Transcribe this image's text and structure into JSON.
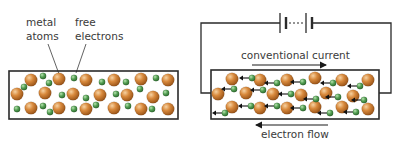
{
  "left_panel": {
    "labels": {
      "metal_atoms": [
        "metal",
        "atoms"
      ],
      "free_electrons": [
        "free",
        "electrons"
      ]
    },
    "box": {
      "x": 9,
      "y": 71,
      "w": 169,
      "h": 48
    },
    "atoms": [
      [
        31,
        80
      ],
      [
        59,
        79
      ],
      [
        86,
        80
      ],
      [
        114,
        80
      ],
      [
        141,
        79
      ],
      [
        168,
        80
      ],
      [
        17,
        94
      ],
      [
        45,
        93
      ],
      [
        73,
        94
      ],
      [
        100,
        95
      ],
      [
        127,
        95
      ],
      [
        153,
        97
      ],
      [
        31,
        108
      ],
      [
        59,
        108
      ],
      [
        86,
        109
      ],
      [
        114,
        108
      ],
      [
        141,
        109
      ],
      [
        168,
        109
      ]
    ],
    "electrons": [
      [
        43,
        76
      ],
      [
        49,
        83
      ],
      [
        24,
        87
      ],
      [
        74,
        78
      ],
      [
        102,
        82
      ],
      [
        126,
        82
      ],
      [
        156,
        78
      ],
      [
        62,
        95
      ],
      [
        86,
        98
      ],
      [
        116,
        94
      ],
      [
        140,
        89
      ],
      [
        166,
        93
      ],
      [
        17,
        109
      ],
      [
        43,
        106
      ],
      [
        50,
        112
      ],
      [
        74,
        109
      ],
      [
        96,
        105
      ],
      [
        128,
        106
      ],
      [
        152,
        109
      ]
    ]
  },
  "right_panel": {
    "circuit": {
      "left": 201,
      "top": 23,
      "right": 391,
      "bottom": 93
    },
    "battery": {
      "long_plates": [
        280,
        306
      ],
      "short_plates": [
        286,
        312
      ],
      "y": 23
    },
    "box": {
      "x": 211,
      "y": 70,
      "w": 168,
      "h": 49
    },
    "conventional_current": {
      "label": "conventional current",
      "arrow_x1": 252,
      "arrow_x2": 328,
      "y": 65
    },
    "electron_flow": {
      "label": "electron flow",
      "arrow_x1": 328,
      "arrow_x2": 254,
      "y": 125
    },
    "atoms": [
      [
        232,
        79
      ],
      [
        260,
        80
      ],
      [
        287,
        80
      ],
      [
        315,
        78
      ],
      [
        342,
        80
      ],
      [
        368,
        80
      ],
      [
        218,
        94
      ],
      [
        246,
        93
      ],
      [
        273,
        94
      ],
      [
        301,
        95
      ],
      [
        326,
        93
      ],
      [
        353,
        96
      ],
      [
        232,
        107
      ],
      [
        260,
        108
      ],
      [
        287,
        108
      ],
      [
        315,
        107
      ],
      [
        342,
        107
      ],
      [
        368,
        109
      ]
    ],
    "electrons_with_arrows": [
      [
        252,
        78
      ],
      [
        277,
        83
      ],
      [
        303,
        82
      ],
      [
        333,
        83
      ],
      [
        360,
        86
      ],
      [
        234,
        89
      ],
      [
        263,
        90
      ],
      [
        291,
        94
      ],
      [
        316,
        99
      ],
      [
        338,
        97
      ],
      [
        364,
        100
      ],
      [
        225,
        113
      ],
      [
        251,
        106
      ],
      [
        277,
        106
      ],
      [
        303,
        108
      ],
      [
        330,
        113
      ],
      [
        356,
        112
      ]
    ]
  },
  "colors": {
    "atom": "#c8782e",
    "atom_highlight": "#f2c48a",
    "electron": "#4f9a4f",
    "electron_highlight": "#a8d8a0",
    "line": "#2a2a2a",
    "text": "#3a3a3a"
  }
}
